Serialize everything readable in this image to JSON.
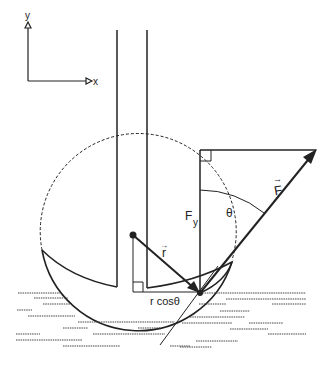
{
  "diagram": {
    "axes": {
      "y_label": "y",
      "x_label": "x"
    },
    "labels": {
      "force": "F",
      "force_vector_mark": "→",
      "force_y": "F",
      "force_y_sub": "y",
      "angle": "θ",
      "radius": "r",
      "radius_vector_mark": "→",
      "r_cos_theta": "r cosθ"
    },
    "colors": {
      "ink": "#222222",
      "background": "#ffffff"
    }
  }
}
